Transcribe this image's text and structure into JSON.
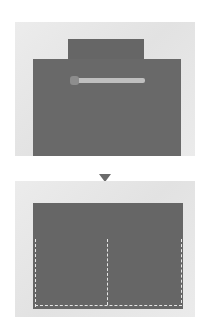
{
  "figure": {
    "steps": [
      {
        "label": "fabric-with-zipper",
        "fabric_color": "#6a6a6a",
        "zipper_color": "#bfbfbf"
      },
      {
        "label": "folded-fabric-stitched",
        "fabric_color": "#666666",
        "stitch_color": "#e6e6e6"
      }
    ],
    "arrow_color": "#6b6b6b",
    "background_color": "#ffffff"
  }
}
